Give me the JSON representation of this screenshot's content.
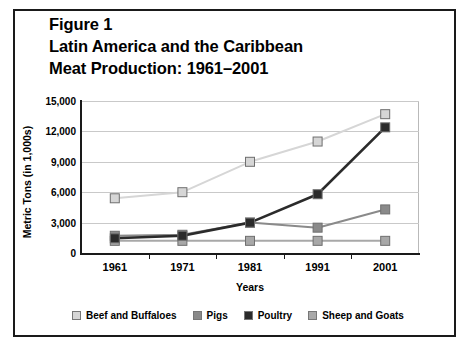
{
  "title": {
    "line1": "Figure 1",
    "line2": "Latin America and the Caribbean",
    "line3": "Meat Production: 1961–2001"
  },
  "chart_data": {
    "type": "line",
    "title": "Figure 1 Latin America and the Caribbean Meat Production: 1961–2001",
    "xlabel": "Years",
    "ylabel": "Metric Tons (in 1,000s)",
    "categories": [
      "1961",
      "1971",
      "1981",
      "1991",
      "2001"
    ],
    "x_tick_labels": [
      "1961",
      "1971",
      "1981",
      "1991",
      "2001"
    ],
    "y_tick_labels": [
      "0",
      "3,000",
      "6,000",
      "9,000",
      "12,000",
      "15,000"
    ],
    "y_tick_values": [
      0,
      3000,
      6000,
      9000,
      12000,
      15000
    ],
    "ylim": [
      0,
      15000
    ],
    "grid": true,
    "legend_position": "bottom",
    "series": [
      {
        "name": "Beef and Buffaloes",
        "color": "#d6d6d6",
        "values": [
          5400,
          6000,
          9000,
          11000,
          13700
        ]
      },
      {
        "name": "Pigs",
        "color": "#8a8a8a",
        "values": [
          1700,
          1800,
          3000,
          2500,
          4300
        ]
      },
      {
        "name": "Poultry",
        "color": "#2b2b2b",
        "values": [
          1450,
          1700,
          3000,
          5800,
          12400
        ]
      },
      {
        "name": "Sheep and Goats",
        "color": "#a8a8a8",
        "values": [
          1200,
          1200,
          1200,
          1200,
          1200
        ]
      }
    ]
  },
  "legend": [
    {
      "label": "Beef and Buffaloes",
      "color": "#d6d6d6"
    },
    {
      "label": "Pigs",
      "color": "#8a8a8a"
    },
    {
      "label": "Poultry",
      "color": "#2b2b2b"
    },
    {
      "label": "Sheep and Goats",
      "color": "#a8a8a8"
    }
  ]
}
